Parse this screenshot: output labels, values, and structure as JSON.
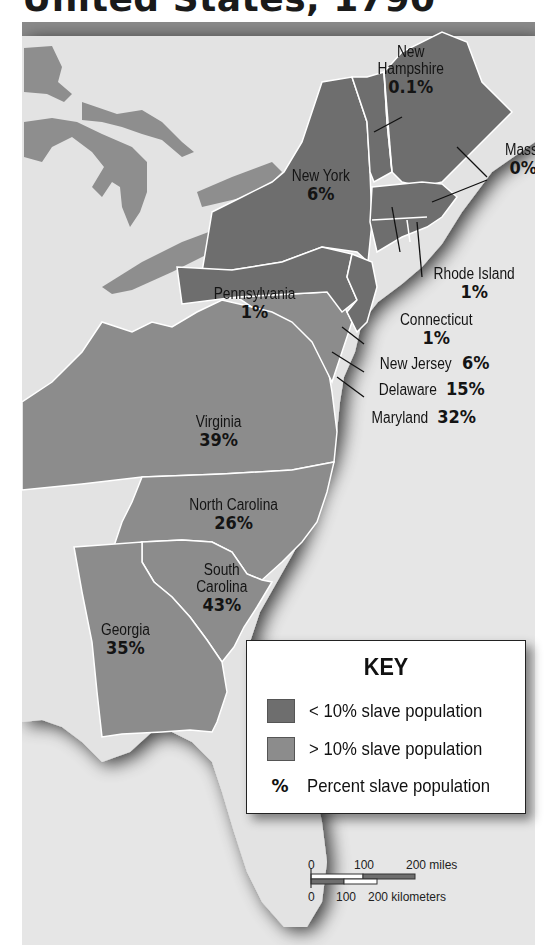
{
  "title": "United States, 1790",
  "colors": {
    "water": "#e6e6e6",
    "land_outside": "#e3e3e3",
    "lakes": "#8e8e8e",
    "below_10": "#6e6e6e",
    "above_10": "#8c8c8c",
    "header_band": "#8a8a8a",
    "border": "#ffffff"
  },
  "states": [
    {
      "name": "New Hampshire",
      "name_lines": [
        "New",
        "Hampshire"
      ],
      "percent": "0.1%",
      "category": "below_10"
    },
    {
      "name": "Mass.",
      "percent": "0%",
      "category": "below_10"
    },
    {
      "name": "New York",
      "percent": "6%",
      "category": "below_10"
    },
    {
      "name": "Rhode Island",
      "percent": "1%",
      "category": "below_10"
    },
    {
      "name": "Pennsylvania",
      "percent": "1%",
      "category": "below_10"
    },
    {
      "name": "Connecticut",
      "percent": "1%",
      "category": "below_10"
    },
    {
      "name": "New Jersey",
      "percent": "6%",
      "category": "below_10"
    },
    {
      "name": "Delaware",
      "percent": "15%",
      "category": "above_10"
    },
    {
      "name": "Maryland",
      "percent": "32%",
      "category": "above_10"
    },
    {
      "name": "Virginia",
      "percent": "39%",
      "category": "above_10"
    },
    {
      "name": "North Carolina",
      "percent": "26%",
      "category": "above_10"
    },
    {
      "name": "South Carolina",
      "name_lines": [
        "South",
        "Carolina"
      ],
      "percent": "43%",
      "category": "above_10"
    },
    {
      "name": "Georgia",
      "percent": "35%",
      "category": "above_10"
    }
  ],
  "key": {
    "title": "KEY",
    "items": [
      {
        "symbol": "swatch-dark",
        "label": "< 10% slave population"
      },
      {
        "symbol": "swatch-light",
        "label": "> 10% slave population"
      },
      {
        "symbol": "%",
        "label": "Percent slave population"
      }
    ]
  },
  "scale_bar": {
    "miles": [
      "0",
      "100",
      "200 miles"
    ],
    "kilometers": [
      "0",
      "100",
      "200 kilometers"
    ]
  }
}
